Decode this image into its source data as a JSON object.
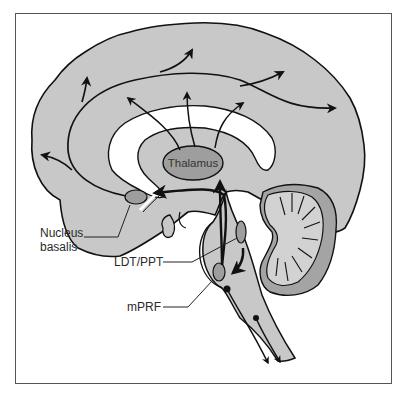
{
  "figure": {
    "labels": {
      "thalamus": "Thalamus",
      "nucleus_basalis_line1": "Nucleus",
      "nucleus_basalis_line2": "basalis",
      "ldt_ppt": "LDT/PPT",
      "mprf": "mPRF"
    },
    "colors": {
      "brain_fill": "#c8c8c8",
      "nucleus_fill": "#9e9e9e",
      "cerebellum_outer": "#a4a4a4",
      "ventricle_fill": "#ffffff",
      "outline": "#111111",
      "frame": "#555555"
    }
  }
}
